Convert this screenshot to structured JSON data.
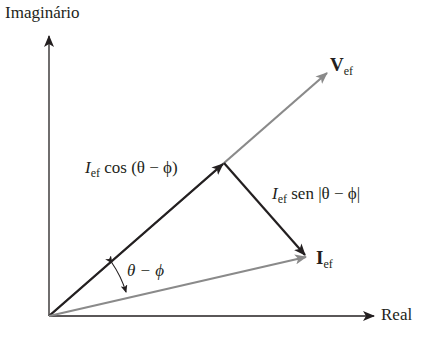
{
  "diagram": {
    "axes": {
      "vertical_label": "Imaginário",
      "horizontal_label": "Real"
    },
    "vectors": {
      "voltage": {
        "symbol": "V",
        "subscript": "ef",
        "color": "#8a8a8a"
      },
      "current": {
        "symbol": "I",
        "subscript": "ef",
        "color": "#8a8a8a"
      },
      "cos_component": {
        "prefix": "I",
        "subscript": "ef",
        "text": " cos (θ − ϕ)",
        "color": "#231f20"
      },
      "sin_component": {
        "prefix": "I",
        "subscript": "ef",
        "text": " sen |θ − ϕ|",
        "color": "#231f20"
      }
    },
    "angle_label": "θ − ϕ",
    "colors": {
      "axis": "#231f20",
      "gray_vector": "#8a8a8a",
      "black_vector": "#231f20"
    }
  }
}
